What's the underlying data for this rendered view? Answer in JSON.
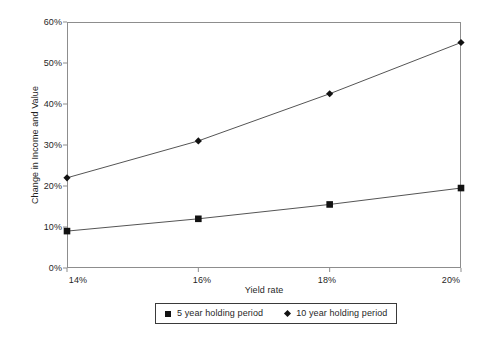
{
  "chart_data": {
    "type": "line",
    "title": "",
    "xlabel": "Yield rate",
    "ylabel": "Change in Income and Value",
    "categories": [
      "14%",
      "16%",
      "18%",
      "20%"
    ],
    "x": [
      14,
      16,
      18,
      20
    ],
    "xlim": [
      14,
      20
    ],
    "ylim": [
      0,
      60
    ],
    "yticks": [
      "0%",
      "10%",
      "20%",
      "30%",
      "40%",
      "50%",
      "60%"
    ],
    "ytick_values": [
      0,
      10,
      20,
      30,
      40,
      50,
      60
    ],
    "grid": false,
    "legend_position": "bottom",
    "series": [
      {
        "name": "5 year holding period",
        "marker": "square",
        "color": "#121212",
        "values": [
          9.0,
          12.0,
          15.5,
          19.5
        ]
      },
      {
        "name": "10 year holding period",
        "marker": "diamond",
        "color": "#121212",
        "values": [
          22.0,
          31.0,
          42.5,
          55.0
        ]
      }
    ]
  },
  "axes": {
    "y_title": "Change in Income and Value",
    "x_title": "Yield rate",
    "y_labels": [
      "60%",
      "50%",
      "40%",
      "30%",
      "20%",
      "10%",
      "0%"
    ],
    "x_labels": [
      "14%",
      "16%",
      "18%",
      "20%"
    ]
  },
  "legend": {
    "items": [
      {
        "label": "5 year holding period",
        "marker": "square-marker"
      },
      {
        "label": "10 year holding period",
        "marker": "diamond-marker"
      }
    ]
  },
  "colors": {
    "line": "#555555",
    "marker": "#121212",
    "frame": "#8d8d8d",
    "text": "#1f1f1f",
    "background": "#ffffff"
  }
}
